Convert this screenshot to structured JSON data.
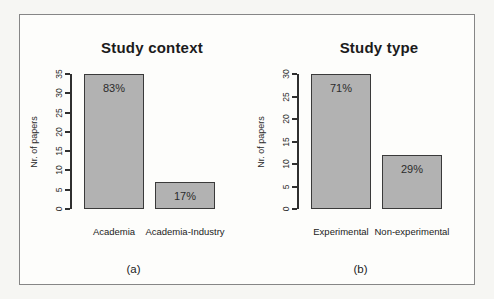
{
  "figure": {
    "caption_a": "(a)",
    "caption_b": "(b)"
  },
  "colors": {
    "page_background": "#f6f6f3",
    "panel_background": "#fdfdfb",
    "frame_border": "#868686",
    "bar_fill": "#b2b2b2",
    "bar_border": "#3a3a3a",
    "axis_color": "#2f2f2f",
    "text_color": "#1b1b1b"
  },
  "chart_data": [
    {
      "type": "bar",
      "title": "Study context",
      "categories": [
        "Academia",
        "Academia-Industry"
      ],
      "values": [
        35,
        7
      ],
      "bar_labels": [
        "83%",
        "17%"
      ],
      "xlabel": "",
      "ylabel": "Nr. of papers",
      "ylim": [
        0,
        35
      ],
      "ytick_step": 5,
      "yticks": [
        0,
        5,
        10,
        15,
        20,
        25,
        30,
        35
      ],
      "grid": false,
      "legend": "none",
      "panel_caption": "(a)"
    },
    {
      "type": "bar",
      "title": "Study type",
      "categories": [
        "Experimental",
        "Non-experimental"
      ],
      "values": [
        30,
        12
      ],
      "bar_labels": [
        "71%",
        "29%"
      ],
      "xlabel": "",
      "ylabel": "Nr. of papers",
      "ylim": [
        0,
        30
      ],
      "ytick_step": 5,
      "yticks": [
        0,
        5,
        10,
        15,
        20,
        25,
        30
      ],
      "grid": false,
      "legend": "none",
      "panel_caption": "(b)"
    }
  ]
}
